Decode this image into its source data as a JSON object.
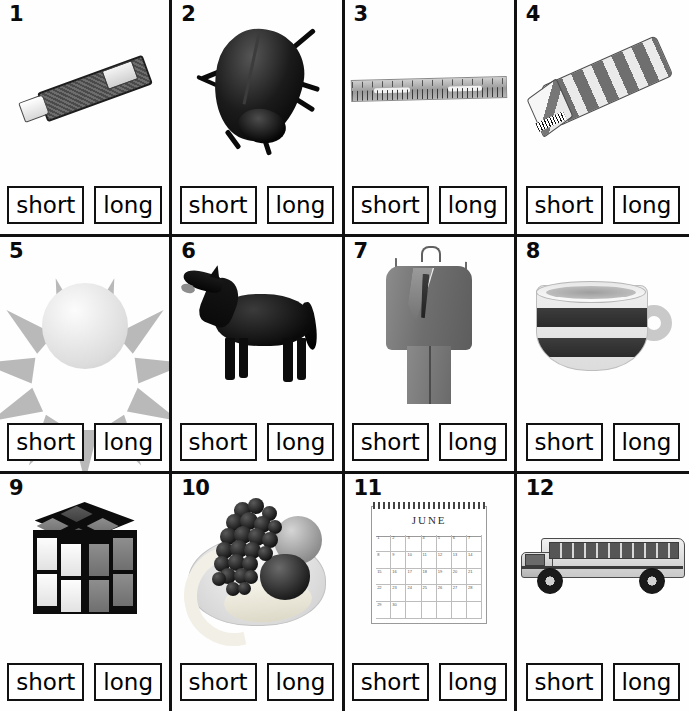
{
  "worksheet": {
    "title": "Short or Long — Picture Sorting Worksheet",
    "answer_options": [
      "short",
      "long"
    ],
    "columns": 4,
    "rows": 3,
    "border_color": "#111111",
    "background_color": "#fdfdfd"
  },
  "items": [
    {
      "number": "1",
      "picture": "toothpaste-tube",
      "picture_label": "toothpaste tube",
      "short_label": "short",
      "long_label": "long"
    },
    {
      "number": "2",
      "picture": "beetle",
      "picture_label": "beetle",
      "short_label": "short",
      "long_label": "long"
    },
    {
      "number": "3",
      "picture": "ruler",
      "picture_label": "ruler",
      "short_label": "short",
      "long_label": "long"
    },
    {
      "number": "4",
      "picture": "gum-pack",
      "picture_label": "striped gum pack",
      "short_label": "short",
      "long_label": "long"
    },
    {
      "number": "5",
      "picture": "sun",
      "picture_label": "sun",
      "short_label": "short",
      "long_label": "long"
    },
    {
      "number": "6",
      "picture": "horse",
      "picture_label": "horse",
      "short_label": "short",
      "long_label": "long"
    },
    {
      "number": "7",
      "picture": "suit",
      "picture_label": "suit on hanger",
      "short_label": "short",
      "long_label": "long"
    },
    {
      "number": "8",
      "picture": "cup",
      "picture_label": "striped cup",
      "short_label": "short",
      "long_label": "long"
    },
    {
      "number": "9",
      "picture": "rubiks-cube",
      "picture_label": "puzzle cube",
      "short_label": "short",
      "long_label": "long"
    },
    {
      "number": "10",
      "picture": "fruit-bowl",
      "picture_label": "bowl of fruit",
      "short_label": "short",
      "long_label": "long"
    },
    {
      "number": "11",
      "picture": "calendar",
      "picture_label": "wall calendar",
      "short_label": "short",
      "long_label": "long"
    },
    {
      "number": "12",
      "picture": "school-bus",
      "picture_label": "school bus",
      "short_label": "short",
      "long_label": "long"
    }
  ],
  "calendar": {
    "month": "JUNE",
    "weekday_headers": [
      "S",
      "M",
      "T",
      "W",
      "T",
      "F",
      "S"
    ],
    "days": [
      "1",
      "2",
      "3",
      "4",
      "5",
      "6",
      "7",
      "8",
      "9",
      "10",
      "11",
      "12",
      "13",
      "14",
      "15",
      "16",
      "17",
      "18",
      "19",
      "20",
      "21",
      "22",
      "23",
      "24",
      "25",
      "26",
      "27",
      "28",
      "29",
      "30",
      "",
      "",
      "",
      "",
      ""
    ]
  }
}
